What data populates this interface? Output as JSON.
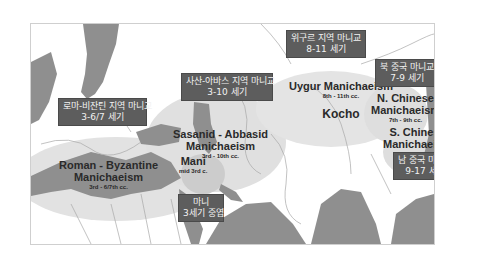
{
  "map": {
    "colors": {
      "land_dark": "#8f8f8f",
      "land_light": "#ffffff",
      "region_halo": "#dedede",
      "label_box_bg": "#5d5d5d",
      "label_box_text": "#f2f2f2",
      "title_text": "#2a2a2a",
      "border_lines": "#bdbdbd"
    },
    "regions": [
      {
        "id": "roman-byzantine",
        "title_line1": "Roman - Byzantine",
        "title_line2": "Manichaeism",
        "period": "3rd - 6/7th cc."
      },
      {
        "id": "sasanid-abbasid",
        "title_line1": "Sasanid - Abbasid",
        "title_line2": "Manichaeism",
        "period": "3rd - 10th cc."
      },
      {
        "id": "mani",
        "title_line1": "Mani",
        "period": "mid 3rd c."
      },
      {
        "id": "uygur",
        "title_line1": "Uygur Manichaeism",
        "period": "8th - 11th cc.",
        "place": "Kocho"
      },
      {
        "id": "n-chinese",
        "title_line1": "N. Chinese",
        "title_line2": "Manichaeism",
        "period": "7th - 9th cc."
      },
      {
        "id": "s-chinese",
        "title_line1": "S. Chinese",
        "title_line2": "Manichaeism",
        "period": "9th - 17th cc."
      }
    ],
    "korean_labels": [
      {
        "id": "roman-byzantine-ko",
        "line1": "로마-비잔틴 지역 마니교",
        "line2": "3-6/7 세기"
      },
      {
        "id": "sasanid-abbasid-ko",
        "line1": "사산-아바스 지역 마니교",
        "line2": "3-10 세기"
      },
      {
        "id": "uygur-ko",
        "line1": "위구르 지역 마니교",
        "line2": "8-11 세기"
      },
      {
        "id": "n-chinese-ko",
        "line1": "북 중국 마니교",
        "line2": "7-9 세기"
      },
      {
        "id": "s-chinese-ko",
        "line1": "남 중국 마니교",
        "line2": "9-17 세기"
      },
      {
        "id": "mani-ko",
        "line1": "마니",
        "line2": "3세기 중엽"
      }
    ]
  }
}
